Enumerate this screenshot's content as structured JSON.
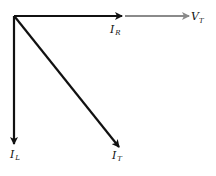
{
  "diagram": {
    "type": "phasor-diagram",
    "colors": {
      "current": "#111111",
      "voltage": "#8a8a8a"
    },
    "phasors": [
      {
        "id": "IR",
        "symbol": "I",
        "subscript": "R",
        "direction": "right",
        "kind": "current"
      },
      {
        "id": "VT",
        "symbol": "V",
        "subscript": "T",
        "direction": "right",
        "kind": "voltage"
      },
      {
        "id": "IL",
        "symbol": "I",
        "subscript": "L",
        "direction": "down",
        "kind": "current"
      },
      {
        "id": "IT",
        "symbol": "I",
        "subscript": "T",
        "direction": "down-right",
        "kind": "current"
      }
    ]
  }
}
